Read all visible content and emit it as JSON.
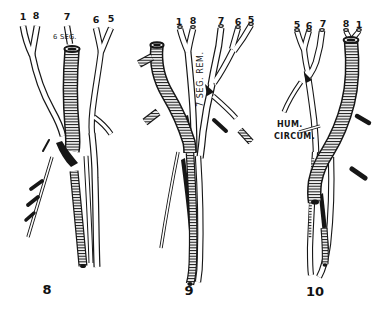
{
  "plate": {
    "paper_color": "#ffffff",
    "ink_color": "#161616",
    "figures": [
      {
        "caption": "8",
        "branch_numbers": [
          "1",
          "8",
          "7",
          "6",
          "5"
        ],
        "annotations": [
          {
            "text": "6 SEG."
          }
        ]
      },
      {
        "caption": "9",
        "branch_numbers": [
          "1",
          "8",
          "7",
          "6",
          "5"
        ],
        "annotations": [
          {
            "text": "7 SEG. REM."
          }
        ]
      },
      {
        "caption": "10",
        "branch_numbers": [
          "5",
          "6",
          "7",
          "8",
          "1"
        ],
        "annotations": [
          {
            "text": "HUM."
          },
          {
            "text": "CIRCUM."
          }
        ]
      }
    ]
  }
}
